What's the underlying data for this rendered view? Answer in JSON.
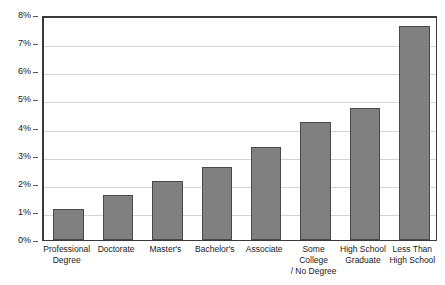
{
  "chart_data": {
    "type": "bar",
    "title": "",
    "subtitle": "",
    "xlabel": "",
    "ylabel": "",
    "categories": [
      "Professional\nDegree",
      "Doctorate",
      "Master's",
      "Bachelor's",
      "Associate",
      "Some College\n/ No Degree",
      "High School\nGraduate",
      "Less Than\nHigh School"
    ],
    "values": [
      1.1,
      1.6,
      2.1,
      2.6,
      3.3,
      4.2,
      4.7,
      7.6
    ],
    "value_unit": "%",
    "ylim": [
      0,
      8
    ],
    "ytick_values": [
      0,
      1,
      2,
      3,
      4,
      5,
      6,
      7,
      8
    ],
    "ytick_labels": [
      "0%",
      "1%",
      "2%",
      "3%",
      "4%",
      "5%",
      "6%",
      "7%",
      "8%"
    ],
    "grid": true,
    "legend": false,
    "legend_position": "none",
    "series": [
      {
        "name": "Unemployment rate",
        "values": [
          1.1,
          1.6,
          2.1,
          2.6,
          3.3,
          4.2,
          4.7,
          7.6
        ]
      }
    ]
  },
  "style": {
    "bar_fill": "#808080",
    "bar_border": "#4a4a4a",
    "gridline_color": "#d4d4d4",
    "axis_color": "#3a3a3a",
    "text_color": "#1a1a1a",
    "background": "#ffffff"
  }
}
